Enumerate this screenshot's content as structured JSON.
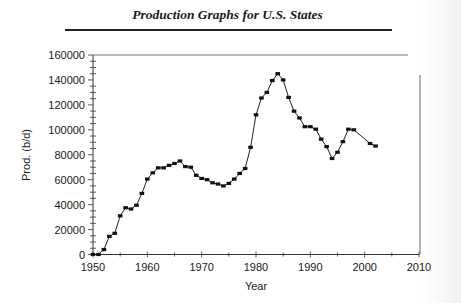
{
  "header": {
    "title": "Production Graphs for U.S. States"
  },
  "chart_data": {
    "type": "line",
    "title": "",
    "xlabel": "Year",
    "ylabel": "Prod. (b/d)",
    "xlim": [
      1950,
      2010
    ],
    "ylim": [
      0,
      160000
    ],
    "x_ticks": [
      1950,
      1960,
      1970,
      1980,
      1990,
      2000,
      2010
    ],
    "x_tick_labels": [
      "1950",
      "1960",
      "1970",
      "1980",
      "1990",
      "2000",
      "2010"
    ],
    "x_minor_step": 5,
    "y_ticks": [
      0,
      20000,
      40000,
      60000,
      80000,
      100000,
      120000,
      140000,
      160000
    ],
    "y_tick_labels": [
      "0",
      "20000",
      "40000",
      "60000",
      "80000",
      "100000",
      "120000",
      "140000",
      "160000"
    ],
    "y_minor_step": 5000,
    "grid": false,
    "legend": null,
    "marker": "square",
    "series": [
      {
        "name": "Production",
        "x": [
          1950,
          1951,
          1952,
          1953,
          1954,
          1955,
          1956,
          1957,
          1958,
          1959,
          1960,
          1961,
          1962,
          1963,
          1964,
          1965,
          1966,
          1967,
          1968,
          1969,
          1970,
          1971,
          1972,
          1973,
          1974,
          1975,
          1976,
          1977,
          1978,
          1979,
          1980,
          1981,
          1982,
          1983,
          1984,
          1985,
          1986,
          1987,
          1988,
          1989,
          1990,
          1991,
          1992,
          1993,
          1994,
          1995,
          1996,
          1997,
          1998,
          2001,
          2002
        ],
        "values": [
          0,
          0,
          4000,
          14500,
          17000,
          31000,
          37500,
          36500,
          39500,
          49000,
          60500,
          65500,
          69500,
          69500,
          71500,
          73000,
          75000,
          70500,
          70000,
          63500,
          61000,
          60000,
          57500,
          56500,
          55000,
          57000,
          60500,
          65000,
          69000,
          86000,
          112000,
          125500,
          130000,
          139500,
          145000,
          140000,
          126000,
          115000,
          109500,
          102500,
          102500,
          100500,
          92500,
          86500,
          77000,
          82000,
          90500,
          100500,
          100000,
          89000,
          87000
        ]
      }
    ]
  },
  "colors": {
    "line": "#222222",
    "marker": "#111111",
    "axis": "#333333",
    "text": "#1a1a1a"
  }
}
